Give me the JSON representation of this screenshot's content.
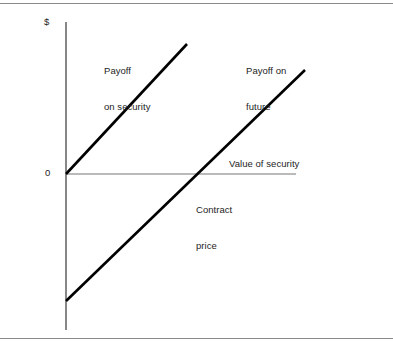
{
  "figure": {
    "background_color": "#ffffff",
    "border_color": "#8a8a8a",
    "line_color": "#000000",
    "axis_color": "#555555",
    "text_color": "#1d1d1d"
  },
  "axes": {
    "y_axis_label": "$",
    "y_origin_tick_label": "0",
    "x_axis_label": "Value of security"
  },
  "annotations": {
    "payoff_security_line1": "Payoff",
    "payoff_security_line2": "on security",
    "payoff_future_line1": "Payoff on",
    "payoff_future_line2": "future",
    "contract_price_line1": "Contract",
    "contract_price_line2": "price"
  },
  "chart_data": {
    "type": "line",
    "title": "",
    "subtitle": "",
    "xlabel": "Value of security",
    "ylabel": "$",
    "grid": false,
    "legend": "inline-annotations",
    "xlim": [
      0,
      1
    ],
    "ylim": [
      -1,
      1
    ],
    "axis_origin_label": "0",
    "x_axis_zero_line": true,
    "annotations": [
      {
        "text": "Payoff on security",
        "x_px": 104,
        "y_px": 41,
        "refers_to": "payoff-on-security-line"
      },
      {
        "text": "Payoff on future",
        "x_px": 246,
        "y_px": 41,
        "refers_to": "payoff-on-future-line"
      },
      {
        "text": "Value of security",
        "x_px": 229,
        "y_px": 158,
        "refers_to": "x-axis"
      },
      {
        "text": "Contract price",
        "x_px": 196,
        "y_px": 180,
        "refers_to": "future-line-x-intercept"
      }
    ],
    "series": [
      {
        "name": "Payoff on security",
        "style": "solid-thick",
        "color": "#000000",
        "points_px": [
          [
            66,
            174
          ],
          [
            187,
            44
          ]
        ],
        "description": "Starts at the origin (value 0, payoff 0) and rises linearly with the value of the security.",
        "x_intercept": 0,
        "y_intercept": 0,
        "slope_sign": "positive"
      },
      {
        "name": "Payoff on future",
        "style": "solid-thick",
        "color": "#000000",
        "points_px": [
          [
            66,
            301
          ],
          [
            305,
            70
          ]
        ],
        "description": "Starts below zero at the contract price loss and rises linearly, crossing zero at the contract price.",
        "x_intercept_px": 197,
        "x_intercept_label": "Contract price",
        "slope_sign": "positive"
      }
    ],
    "geometry_px": {
      "y_axis_x": 66,
      "y_axis_top": 22,
      "y_axis_bottom": 330,
      "x_axis_y": 174,
      "x_axis_left": 66,
      "x_axis_right": 296
    }
  }
}
